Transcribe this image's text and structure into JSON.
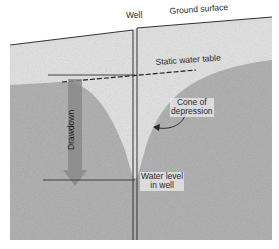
{
  "diagram": {
    "labels": {
      "well": "Well",
      "ground_surface": "Ground surface",
      "static_water_table": "Static water table",
      "cone_of_depression_line1": "Cone of",
      "cone_of_depression_line2": "depression",
      "drawdown": "Drawdown",
      "water_level_line1": "Water level",
      "water_level_line2": "in well"
    },
    "colors": {
      "unsaturated_zone": "#e4e4e4",
      "saturated_zone": "#b4b4b4",
      "drawdown_arrow": "#8a8a8a",
      "lines": "#333333",
      "background": "#ffffff"
    }
  }
}
